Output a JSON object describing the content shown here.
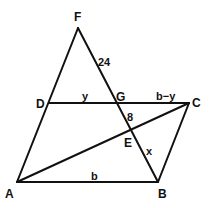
{
  "diagram": {
    "type": "geometry-figure",
    "points": {
      "A": {
        "label": "A",
        "x": 17,
        "y": 182
      },
      "B": {
        "label": "B",
        "x": 158,
        "y": 182
      },
      "C": {
        "label": "C",
        "x": 189,
        "y": 103
      },
      "D": {
        "label": "D",
        "x": 49,
        "y": 103
      },
      "E": {
        "label": "E",
        "x": 132,
        "y": 130
      },
      "F": {
        "label": "F",
        "x": 78,
        "y": 28
      },
      "G": {
        "label": "G",
        "x": 119,
        "y": 103
      }
    },
    "segments": [
      {
        "from": "A",
        "to": "B"
      },
      {
        "from": "B",
        "to": "C"
      },
      {
        "from": "D",
        "to": "C"
      },
      {
        "from": "A",
        "to": "F"
      },
      {
        "from": "F",
        "to": "B"
      },
      {
        "from": "A",
        "to": "C"
      }
    ],
    "measure_labels": {
      "FG": "24",
      "DG": "y",
      "GC": "b−y",
      "GE": "8",
      "EB": "x",
      "AB": "b"
    }
  }
}
